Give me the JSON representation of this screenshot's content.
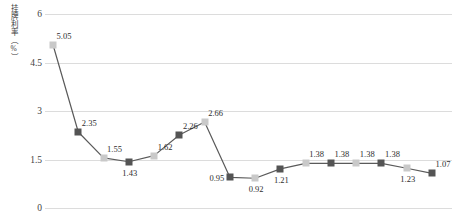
{
  "chart_data": {
    "type": "line",
    "title": "",
    "xlabel": "",
    "ylabel": "挂牌利率（%）",
    "ylim": [
      0,
      6
    ],
    "yticks": [
      "0",
      "1.5",
      "3",
      "4.5",
      "6"
    ],
    "grid": true,
    "legend": "none",
    "x": [
      1,
      2,
      3,
      4,
      5,
      6,
      7,
      8,
      9,
      10,
      11,
      12,
      13,
      14,
      15,
      16
    ],
    "values": [
      5.05,
      2.35,
      1.55,
      1.43,
      1.62,
      2.26,
      2.66,
      0.95,
      0.92,
      1.21,
      1.38,
      1.38,
      1.38,
      1.38,
      1.23,
      1.07
    ],
    "point_labels": [
      "5.05",
      "2.35",
      "1.55",
      "1.43",
      "1.62",
      "2.26",
      "2.66",
      "0.95",
      "0.92",
      "1.21",
      "1.38",
      "1.38",
      "1.38",
      "1.38",
      "1.23",
      "1.07"
    ],
    "marker_styles": [
      "light",
      "dark",
      "light",
      "dark",
      "light",
      "dark",
      "light",
      "dark",
      "light",
      "dark",
      "light",
      "dark",
      "light",
      "dark",
      "light",
      "dark"
    ],
    "label_positions": [
      "above",
      "above",
      "above",
      "below",
      "above",
      "above",
      "above",
      "left",
      "below",
      "below",
      "above",
      "above",
      "above",
      "above",
      "below",
      "above"
    ],
    "colors": {
      "line": "#5a5a5a",
      "marker_light": "#c9c9c9",
      "marker_dark": "#545454",
      "gridline": "#dcdcdc",
      "text": "#2e2e2e",
      "background": "#ffffff"
    }
  }
}
